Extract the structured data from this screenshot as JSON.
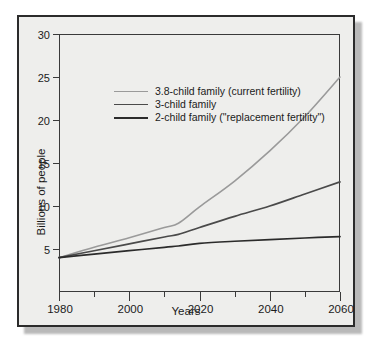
{
  "chart_data": {
    "type": "line",
    "title": "",
    "xlabel": "Years",
    "ylabel": "Billions of people",
    "xlim": [
      1980,
      2060
    ],
    "ylim": [
      0,
      30
    ],
    "xticks": [
      1980,
      1990,
      2000,
      2010,
      2020,
      2030,
      2040,
      2050,
      2060
    ],
    "xtick_labels": [
      "1980",
      "",
      "2000",
      "",
      "2020",
      "",
      "2040",
      "",
      "2060"
    ],
    "yticks": [
      5,
      10,
      15,
      20,
      25,
      30
    ],
    "ytick_labels": [
      "5",
      "10",
      "15",
      "20",
      "25",
      "30"
    ],
    "grid": false,
    "legend_position": "upper-left-inside",
    "x": [
      1980,
      1990,
      2000,
      2010,
      2014,
      2020,
      2030,
      2040,
      2050,
      2060
    ],
    "series": [
      {
        "name": "3.8-child family (current fertility)",
        "color": "#9a9a9a",
        "values": [
          4.0,
          5.2,
          6.3,
          7.5,
          8.0,
          9.9,
          12.9,
          16.4,
          20.4,
          25.0
        ]
      },
      {
        "name": "3-child family",
        "color": "#4a4a4a",
        "values": [
          4.0,
          4.8,
          5.6,
          6.4,
          6.7,
          7.5,
          8.8,
          10.0,
          11.4,
          12.8
        ]
      },
      {
        "name": "2-child family (\"replacement fertility\")",
        "color": "#2b2b2b",
        "values": [
          4.0,
          4.4,
          4.8,
          5.2,
          5.35,
          5.65,
          5.9,
          6.1,
          6.28,
          6.45
        ]
      }
    ]
  },
  "axis": {
    "ylabel": "Billions of people",
    "xlabel": "Years",
    "ytick_labels": [
      "30",
      "25",
      "20",
      "15",
      "10",
      "5"
    ],
    "xtick_labels": [
      "1980",
      "2000",
      "2020",
      "2040",
      "2060"
    ]
  },
  "legend": {
    "items": [
      {
        "label": "3.8-child family (current fertility)",
        "color": "#9a9a9a"
      },
      {
        "label": "3-child family",
        "color": "#4a4a4a"
      },
      {
        "label": "2-child family (\"replacement fertility\")",
        "color": "#2b2b2b"
      }
    ]
  },
  "colors": {
    "plate_background": "#eeeeec",
    "frame": "#2b2b2b",
    "axis": "#3a3a3a",
    "text": "#1b1b1b",
    "page_background": "#ffffff"
  }
}
